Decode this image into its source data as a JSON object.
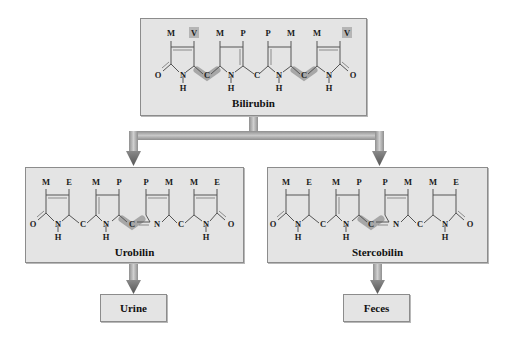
{
  "diagram": {
    "nodes": {
      "bilirubin": {
        "label": "Bilirubin",
        "substituents": [
          "M",
          "V",
          "M",
          "P",
          "P",
          "M",
          "M",
          "V"
        ],
        "highlighted_substituents": [
          "V",
          "V"
        ]
      },
      "urobilin": {
        "label": "Urobilin",
        "substituents": [
          "M",
          "E",
          "M",
          "P",
          "P",
          "M",
          "M",
          "E"
        ]
      },
      "stercobilin": {
        "label": "Stercobilin",
        "substituents": [
          "M",
          "E",
          "M",
          "P",
          "P",
          "M",
          "M",
          "E"
        ]
      },
      "urine": {
        "label": "Urine"
      },
      "feces": {
        "label": "Feces"
      }
    },
    "atoms": {
      "O": "O",
      "N": "N",
      "H": "H",
      "C": "C"
    },
    "edges": [
      {
        "from": "Bilirubin",
        "to": "Urobilin"
      },
      {
        "from": "Bilirubin",
        "to": "Stercobilin"
      },
      {
        "from": "Urobilin",
        "to": "Urine"
      },
      {
        "from": "Stercobilin",
        "to": "Feces"
      }
    ],
    "colors": {
      "box_fill": "#e4e4e4",
      "box_border": "#8c8c8c",
      "arrow": "#8a8a8a",
      "highlight": "#9c9c9c"
    }
  }
}
